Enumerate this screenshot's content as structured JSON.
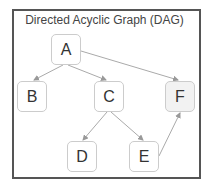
{
  "title": "Directed Acyclic Graph (DAG)",
  "nodes": [
    {
      "id": "A",
      "label": "A",
      "x": 51,
      "y": 34,
      "fill": "#ffffff"
    },
    {
      "id": "B",
      "label": "B",
      "x": 17,
      "y": 81,
      "fill": "#ffffff"
    },
    {
      "id": "C",
      "label": "C",
      "x": 94,
      "y": 81,
      "fill": "#ffffff"
    },
    {
      "id": "F",
      "label": "F",
      "x": 165,
      "y": 81,
      "fill": "#f2f2f2"
    },
    {
      "id": "D",
      "label": "D",
      "x": 67,
      "y": 141,
      "fill": "#ffffff"
    },
    {
      "id": "E",
      "label": "E",
      "x": 129,
      "y": 141,
      "fill": "#ffffff"
    }
  ],
  "edges": [
    {
      "from": "A",
      "to": "B"
    },
    {
      "from": "A",
      "to": "C"
    },
    {
      "from": "A",
      "to": "F"
    },
    {
      "from": "C",
      "to": "D"
    },
    {
      "from": "C",
      "to": "E"
    },
    {
      "from": "E",
      "to": "F"
    }
  ],
  "colors": {
    "edge": "#aaaaaa",
    "border": "#555555",
    "node_border": "#cccccc"
  }
}
